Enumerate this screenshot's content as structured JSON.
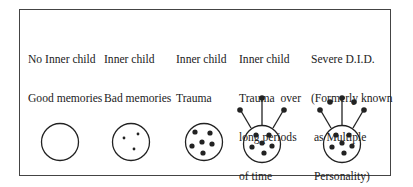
{
  "diagram": {
    "stages": [
      {
        "lines": [
          "No Inner child",
          "Good memories"
        ]
      },
      {
        "lines": [
          "Inner child",
          "Bad memories"
        ]
      },
      {
        "lines": [
          "Inner child",
          "Trauma"
        ]
      },
      {
        "lines": [
          "Inner child",
          "Trauma  over",
          "long periods",
          "of time",
          "(D.I.D.)"
        ]
      },
      {
        "lines": [
          "Severe D.I.D.",
          "(Formerly known",
          " as Multiple",
          " Personality)"
        ]
      }
    ],
    "colors": {
      "stroke": "#222222",
      "background": "#ffffff"
    }
  }
}
